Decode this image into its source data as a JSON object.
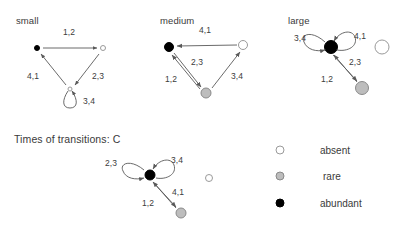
{
  "figure": {
    "background": "#ffffff",
    "legend_title": "",
    "bottom_section_title": "Times of transitions: C"
  },
  "colors": {
    "abundant": "#000000",
    "rare": "#bdbdbd",
    "absent": "#ffffff",
    "edge": "#595959",
    "text": "#3a3a3a"
  },
  "panels": [
    {
      "id": "small",
      "title": "small",
      "title_pos": {
        "x": 16,
        "y": 22
      },
      "nodes": [
        {
          "name": "node-abundant",
          "state": "abundant",
          "x": 37,
          "y": 48,
          "r": 3.0
        },
        {
          "name": "node-absent",
          "state": "absent",
          "x": 103,
          "y": 48,
          "r": 3.0
        },
        {
          "name": "node-absent-lower",
          "state": "absent",
          "x": 70,
          "y": 89,
          "r": 2.5
        }
      ],
      "edge_labels": [
        {
          "name": "edge-label-1-2",
          "text": "1,2",
          "x": 69,
          "y": 32
        },
        {
          "name": "edge-label-2-3",
          "text": "2,3",
          "x": 98,
          "y": 76
        },
        {
          "name": "edge-label-4-1",
          "text": "4,1",
          "x": 33,
          "y": 76
        },
        {
          "name": "edge-label-3-4",
          "text": "3,4",
          "x": 89,
          "y": 101
        }
      ]
    },
    {
      "id": "medium",
      "title": "medium",
      "title_pos": {
        "x": 160,
        "y": 22
      },
      "nodes": [
        {
          "name": "node-abundant",
          "state": "abundant",
          "x": 169,
          "y": 47,
          "r": 5.0
        },
        {
          "name": "node-absent",
          "state": "absent",
          "x": 243,
          "y": 45,
          "r": 5.0
        },
        {
          "name": "node-rare",
          "state": "rare",
          "x": 206,
          "y": 93,
          "r": 5.5
        }
      ],
      "edge_labels": [
        {
          "name": "edge-label-4-1",
          "text": "4,1",
          "x": 205,
          "y": 30
        },
        {
          "name": "edge-label-2-3",
          "text": "2,3",
          "x": 197,
          "y": 62
        },
        {
          "name": "edge-label-1-2",
          "text": "1,2",
          "x": 171,
          "y": 79
        },
        {
          "name": "edge-label-3-4",
          "text": "3,4",
          "x": 237,
          "y": 76
        }
      ]
    },
    {
      "id": "large",
      "title": "large",
      "title_pos": {
        "x": 288,
        "y": 22
      },
      "nodes": [
        {
          "name": "node-abundant",
          "state": "abundant",
          "x": 331,
          "y": 47,
          "r": 7.0
        },
        {
          "name": "node-rare",
          "state": "rare",
          "x": 362,
          "y": 88,
          "r": 7.0
        },
        {
          "name": "node-absent-isolated",
          "state": "absent",
          "x": 382,
          "y": 47,
          "r": 7.5
        }
      ],
      "edge_labels": [
        {
          "name": "edge-label-3-4",
          "text": "3,4",
          "x": 300,
          "y": 38
        },
        {
          "name": "edge-label-4-1",
          "text": "4,1",
          "x": 360,
          "y": 36
        },
        {
          "name": "edge-label-2-3",
          "text": "2,3",
          "x": 355,
          "y": 62
        },
        {
          "name": "edge-label-1-2",
          "text": "1,2",
          "x": 327,
          "y": 79
        }
      ]
    },
    {
      "id": "transitions-c",
      "title": "Times of transitions: C",
      "title_pos": {
        "x": 14,
        "y": 141
      },
      "nodes": [
        {
          "name": "node-abundant",
          "state": "abundant",
          "x": 150,
          "y": 175,
          "r": 5.5
        },
        {
          "name": "node-rare",
          "state": "rare",
          "x": 181,
          "y": 213,
          "r": 5.5
        },
        {
          "name": "node-absent-isolated",
          "state": "absent",
          "x": 209,
          "y": 178,
          "r": 4.0
        }
      ],
      "edge_labels": [
        {
          "name": "edge-label-2-3",
          "text": "2,3",
          "x": 111,
          "y": 163
        },
        {
          "name": "edge-label-3-4",
          "text": "3,4",
          "x": 177,
          "y": 160
        },
        {
          "name": "edge-label-4-1",
          "text": "4,1",
          "x": 178,
          "y": 192
        },
        {
          "name": "edge-label-1-2",
          "text": "1,2",
          "x": 148,
          "y": 203
        }
      ]
    }
  ],
  "legend": {
    "items": [
      {
        "name": "legend-item-absent",
        "label": "absent",
        "state": "absent",
        "marker": {
          "x": 280,
          "y": 150,
          "r": 4.5
        },
        "label_pos": {
          "x": 320,
          "y": 150
        }
      },
      {
        "name": "legend-item-rare",
        "label": "rare",
        "state": "rare",
        "marker": {
          "x": 280,
          "y": 176,
          "r": 4.5
        },
        "label_pos": {
          "x": 323,
          "y": 176
        }
      },
      {
        "name": "legend-item-abundant",
        "label": "abundant",
        "state": "abundant",
        "marker": {
          "x": 280,
          "y": 203,
          "r": 4.5
        },
        "label_pos": {
          "x": 320,
          "y": 203
        }
      }
    ]
  }
}
